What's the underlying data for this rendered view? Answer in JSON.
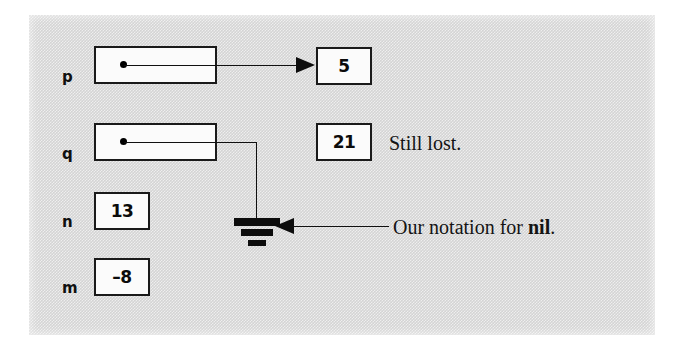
{
  "figure": {
    "kind": "pointer-variable-diagram",
    "background_color": "#d4d4d4",
    "ink_color": "#101010",
    "cell_fill_color": "#fbfbfb"
  },
  "variables": [
    {
      "name": "p",
      "label": "p",
      "cell_kind": "pointer",
      "value": "",
      "points_to": "node-5"
    },
    {
      "name": "q",
      "label": "q",
      "cell_kind": "pointer",
      "value": "",
      "points_to": "nil"
    },
    {
      "name": "n",
      "label": "n",
      "cell_kind": "integer",
      "value": "13",
      "points_to": ""
    },
    {
      "name": "m",
      "label": "m",
      "cell_kind": "integer",
      "value": "–8",
      "points_to": ""
    }
  ],
  "heap_nodes": [
    {
      "id": "node-5",
      "value": "5",
      "referenced_by": "p"
    },
    {
      "id": "node-21",
      "value": "21",
      "referenced_by": ""
    }
  ],
  "annotations": [
    {
      "id": "still-lost",
      "text": "Still lost.",
      "target": "node-21"
    },
    {
      "id": "nil-note",
      "text_before": "Our notation for ",
      "text_emphasis": "nil",
      "text_after": ".",
      "target": "nil-symbol"
    }
  ],
  "nil_symbol": {
    "name": "ground-symbol",
    "bars": 3,
    "description": "electrical ground glyph denoting nil"
  }
}
